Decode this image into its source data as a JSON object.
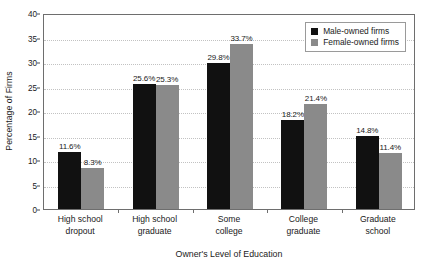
{
  "chart_data": {
    "type": "bar",
    "title": "",
    "xlabel": "Owner's Level of Education",
    "ylabel": "Percentage of Firms",
    "ylim": [
      0,
      40
    ],
    "ytick_step": 5,
    "yticks": [
      "0",
      "5",
      "10",
      "15",
      "20",
      "25",
      "30",
      "35",
      "40"
    ],
    "grid": true,
    "legend_position": "top-right-inside",
    "categories": [
      "High school\ndropout",
      "High school\ngraduate",
      "Some\ncollege",
      "College\ngraduate",
      "Graduate\nschool"
    ],
    "category_lines": [
      [
        "High school",
        "dropout"
      ],
      [
        "High school",
        "graduate"
      ],
      [
        "Some",
        "college"
      ],
      [
        "College",
        "graduate"
      ],
      [
        "Graduate",
        "school"
      ]
    ],
    "series": [
      {
        "name": "Male-owned firms",
        "color": "#111111",
        "values": [
          11.6,
          25.6,
          29.8,
          18.2,
          14.8
        ],
        "labels": [
          "11.6%",
          "25.6%",
          "29.8%",
          "18.2%",
          "14.8%"
        ]
      },
      {
        "name": "Female-owned firms",
        "color": "#8a8a8a",
        "values": [
          8.3,
          25.3,
          33.7,
          21.4,
          11.4
        ],
        "labels": [
          "8.3%",
          "25.3%",
          "33.7%",
          "21.4%",
          "11.4%"
        ]
      }
    ]
  },
  "legend": {
    "items": [
      {
        "label": "Male-owned firms",
        "swatch": "male"
      },
      {
        "label": "Female-owned firms",
        "swatch": "female"
      }
    ]
  },
  "axes": {
    "y_title": "Percentage of Firms",
    "x_title": "Owner's Level of Education"
  }
}
